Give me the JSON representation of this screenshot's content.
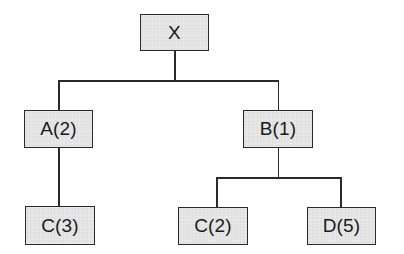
{
  "diagram": {
    "type": "tree",
    "root": {
      "label": "X",
      "children": [
        {
          "label": "A(2)",
          "children": [
            {
              "label": "C(3)"
            }
          ]
        },
        {
          "label": "B(1)",
          "children": [
            {
              "label": "C(2)"
            },
            {
              "label": "D(5)"
            }
          ]
        }
      ]
    },
    "nodes": {
      "x": "X",
      "a": "A(2)",
      "b": "B(1)",
      "c3": "C(3)",
      "c2": "C(2)",
      "d5": "D(5)"
    },
    "colors": {
      "node_fill": "#e4e4e4",
      "line": "#2a2a2a",
      "text": "#1a1a1a"
    }
  }
}
